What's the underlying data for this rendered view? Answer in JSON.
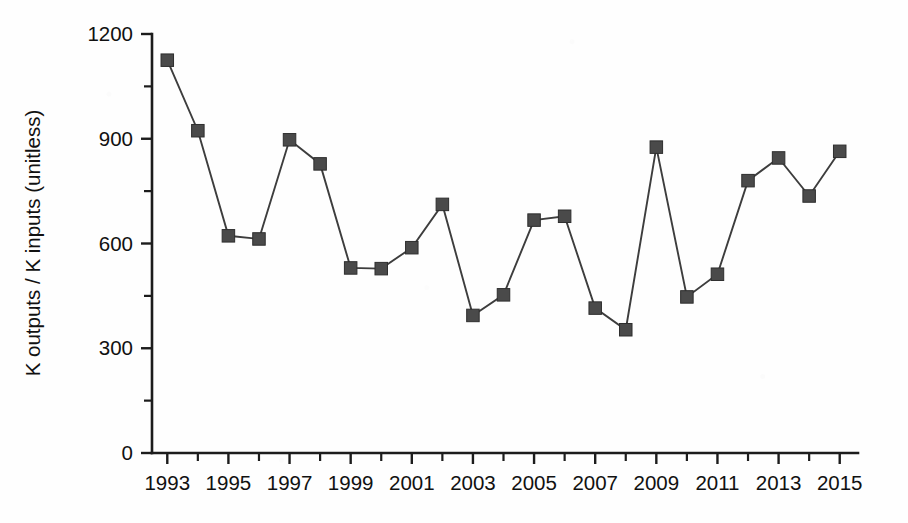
{
  "chart_data": {
    "type": "line",
    "title": "",
    "xlabel": "",
    "ylabel": "K outputs / K inputs (unitless)",
    "xlim": [
      1992.5,
      2015.5
    ],
    "ylim": [
      0,
      1200
    ],
    "grid": false,
    "legend": "none",
    "marker": "filled-square",
    "series_color": "#4a4a4a",
    "y_ticks": [
      0,
      300,
      600,
      900,
      1200
    ],
    "y_minor_ticks": [
      150,
      450,
      750,
      1050
    ],
    "x_ticks": [
      1993,
      1995,
      1997,
      1999,
      2001,
      2003,
      2005,
      2007,
      2009,
      2011,
      2013,
      2015
    ],
    "x_tick_labels": [
      "1993",
      "1995",
      "1997",
      "1999",
      "2001",
      "2003",
      "2005",
      "2007",
      "2009",
      "2011",
      "2013",
      "2015"
    ],
    "x_minor_ticks": [
      1994,
      1996,
      1998,
      2000,
      2002,
      2004,
      2006,
      2008,
      2010,
      2012,
      2014
    ],
    "x": [
      1993,
      1994,
      1995,
      1996,
      1997,
      1998,
      1999,
      2000,
      2001,
      2002,
      2003,
      2004,
      2005,
      2006,
      2007,
      2008,
      2009,
      2010,
      2011,
      2012,
      2013,
      2014,
      2015
    ],
    "values": [
      1125,
      923,
      622,
      613,
      897,
      828,
      530,
      528,
      588,
      712,
      394,
      453,
      667,
      678,
      415,
      353,
      876,
      447,
      512,
      780,
      845,
      736,
      864
    ],
    "series": [
      {
        "name": "K outputs / K inputs",
        "values": [
          1125,
          923,
          622,
          613,
          897,
          828,
          530,
          528,
          588,
          712,
          394,
          453,
          667,
          678,
          415,
          353,
          876,
          447,
          512,
          780,
          845,
          736,
          864
        ]
      }
    ]
  }
}
